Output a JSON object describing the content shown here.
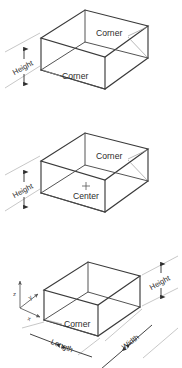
{
  "diagram": {
    "panels": [
      {
        "id": "panel-corner",
        "labels": {
          "corner_upper": "Corner",
          "corner_lower": "Corner",
          "height": "Height"
        }
      },
      {
        "id": "panel-center",
        "labels": {
          "corner_upper": "Corner",
          "center": "Center",
          "height": "Height"
        }
      },
      {
        "id": "panel-dimensions",
        "labels": {
          "corner": "Corner",
          "height": "Height",
          "length": "Length",
          "width": "Width"
        },
        "axes": {
          "z": "z",
          "y": "y",
          "x": "x"
        }
      }
    ],
    "colors": {
      "background": "#ffffff",
      "box_edge": "#3a3a3a",
      "extension_line": "#b9b9b9",
      "leader_line": "#9a9a9a",
      "dimension_line": "#2e2e2e",
      "text": "#2b2b2b",
      "axis": "#555555"
    },
    "markers": {
      "center_cross": "+"
    }
  }
}
